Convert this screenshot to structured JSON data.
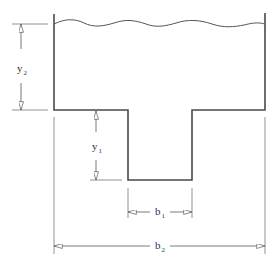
{
  "diagram": {
    "type": "channel-cross-section",
    "colors": {
      "stroke": "#4a4a4a",
      "dim": "#777777",
      "background": "#ffffff"
    },
    "labels": {
      "y2": {
        "base": "y",
        "sub": "2"
      },
      "y1": {
        "base": "y",
        "sub": "1"
      },
      "b1": {
        "base": "b",
        "sub": "1"
      },
      "b2": {
        "base": "b",
        "sub": "2"
      }
    }
  }
}
